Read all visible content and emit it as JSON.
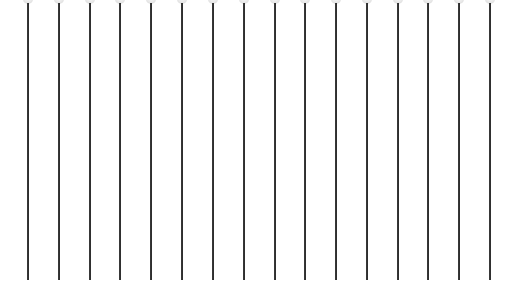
{
  "scene": {
    "description": "Row of vertical pins with light gray round heads",
    "background_color": "#ffffff",
    "shaft_color": "#1a1a1a",
    "head_color": "#e6e6e6",
    "pin_count": 16,
    "pins_x": [
      28,
      59,
      90,
      120,
      151,
      182,
      213,
      244,
      275,
      305,
      336,
      367,
      398,
      428,
      459,
      490
    ]
  }
}
